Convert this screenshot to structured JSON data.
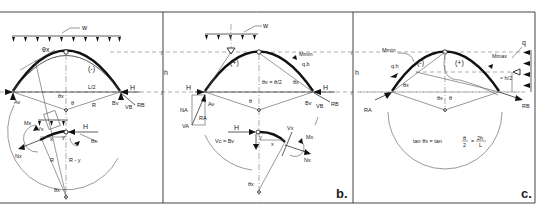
{
  "figure": {
    "panels": [
      {
        "id": "a",
        "label": "",
        "load_label": "w",
        "moment_sign": "(-)",
        "labels": {
          "theta_x_top": "θx",
          "span_half": "L/2",
          "support_left_vertical": "Av",
          "support_right_vertical": "Bv",
          "support_right_shear": "VB",
          "support_right_reaction": "RB",
          "horizontal": "H",
          "theta_x_center": "θx",
          "theta": "θ",
          "radius": "R",
          "moment": "Mx",
          "shear": "Vx",
          "normal": "Nx",
          "x": "x",
          "y": "y",
          "h_free": "H",
          "theta_x_free": "θx",
          "radius_free": "R",
          "radius_minus_y": "R - y",
          "theta_x_bottom": "θx"
        }
      },
      {
        "id": "b",
        "label": "b.",
        "load_label": "w",
        "moment_sign": "(+)",
        "labels": {
          "moment_min": "Mmin",
          "qb": "q.b",
          "theta_x_eq": "θx = θ/2",
          "theta_x": "θx",
          "theta": "θ",
          "horizontal_left": "H",
          "horizontal_right": "H",
          "support_left_vertical": "Av",
          "support_left_normal": "NA",
          "support_left_reaction": "RA",
          "support_left_shear": "VA",
          "support_right_vertical": "Bv",
          "support_right_shear": "VB",
          "support_right_reaction": "RB",
          "crown_horizontal": "H",
          "crown_shear_eq": "Vc = Bv",
          "shear": "Vx",
          "moment": "Mx",
          "normal": "Nx",
          "x": "x",
          "y": "y",
          "theta_x_bottom": "θx"
        }
      },
      {
        "id": "c",
        "label": "c.",
        "load_label": "q",
        "moment_sign_neg": "(-)",
        "moment_sign_pos": "(+)",
        "labels": {
          "moment_min": "Mmin",
          "moment_max": "Mmax",
          "qh": "q.h",
          "h_over_2": "≈ h/2",
          "theta_x": "θx",
          "theta_x_center": "θx",
          "theta": "θ",
          "reaction_left": "RA",
          "reaction_right": "RB"
        },
        "formula": {
          "lhs": "tan θx = tan",
          "frac1_num": "θ",
          "frac1_den": "2",
          "eq": "=",
          "frac2_num": "2h",
          "frac2_den": "L"
        }
      }
    ],
    "dimension_label": "h"
  }
}
